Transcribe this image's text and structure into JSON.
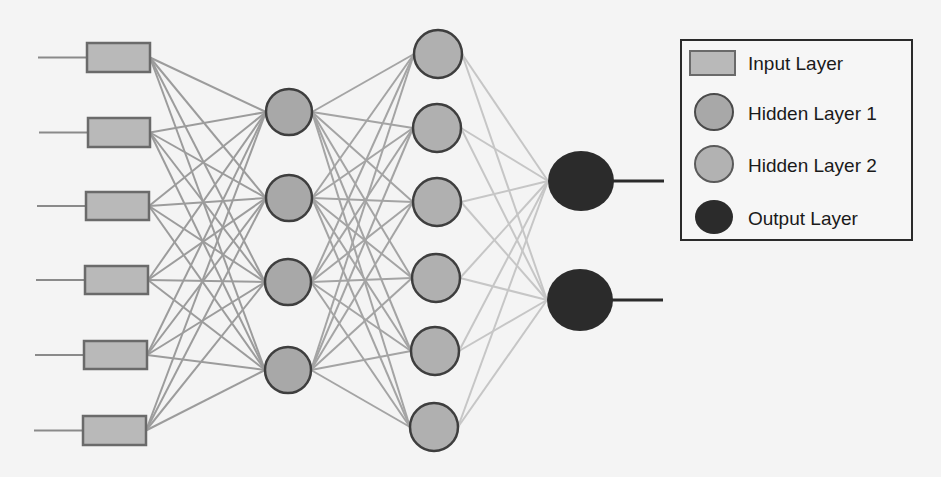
{
  "diagram": {
    "type": "neural-network",
    "colors": {
      "background": "#f4f4f4",
      "input_fill": "#b9b9b9",
      "input_stroke": "#6a6a6a",
      "hidden1_fill": "#a8a8a8",
      "hidden2_fill": "#b0b0b0",
      "hidden_stroke": "#3e3e3e",
      "output_fill": "#2b2b2b",
      "edge_in_h1": "#9c9c9c",
      "edge_h1_h2": "#a4a4a4",
      "edge_h2_out": "#c6c6c6",
      "io_line": "#8a8a8a",
      "output_line": "#2b2b2b",
      "legend_border": "#2a2a2a"
    },
    "layers": [
      {
        "name": "Input Layer",
        "shape": "rect",
        "nodes": [
          {
            "x": 87,
            "y": 43,
            "w": 63,
            "h": 29
          },
          {
            "x": 88,
            "y": 118,
            "w": 62,
            "h": 29
          },
          {
            "x": 86,
            "y": 192,
            "w": 63,
            "h": 28
          },
          {
            "x": 85,
            "y": 266,
            "w": 63,
            "h": 28
          },
          {
            "x": 84,
            "y": 341,
            "w": 63,
            "h": 28
          },
          {
            "x": 83,
            "y": 416,
            "w": 63,
            "h": 29
          }
        ]
      },
      {
        "name": "Hidden Layer 1",
        "shape": "circle",
        "r": 23,
        "nodes": [
          {
            "cx": 289,
            "cy": 112
          },
          {
            "cx": 289,
            "cy": 198
          },
          {
            "cx": 288,
            "cy": 282
          },
          {
            "cx": 288,
            "cy": 370
          }
        ]
      },
      {
        "name": "Hidden Layer 2",
        "shape": "circle",
        "r": 24,
        "nodes": [
          {
            "cx": 438,
            "cy": 54
          },
          {
            "cx": 437,
            "cy": 128
          },
          {
            "cx": 437,
            "cy": 202
          },
          {
            "cx": 436,
            "cy": 278
          },
          {
            "cx": 435,
            "cy": 351
          },
          {
            "cx": 434,
            "cy": 427
          }
        ]
      },
      {
        "name": "Output Layer",
        "shape": "circle",
        "nodes": [
          {
            "cx": 581,
            "cy": 181,
            "rx": 33,
            "ry": 30
          },
          {
            "cx": 580,
            "cy": 300,
            "rx": 33,
            "ry": 31
          }
        ]
      }
    ],
    "legend": {
      "box": {
        "x": 681,
        "y": 40,
        "w": 231,
        "h": 200
      },
      "items": [
        {
          "label": "Input Layer",
          "swatch": "rect"
        },
        {
          "label": "Hidden Layer 1",
          "swatch": "circle"
        },
        {
          "label": "Hidden Layer 2",
          "swatch": "circle"
        },
        {
          "label": "Output Layer",
          "swatch": "circle"
        }
      ]
    }
  }
}
